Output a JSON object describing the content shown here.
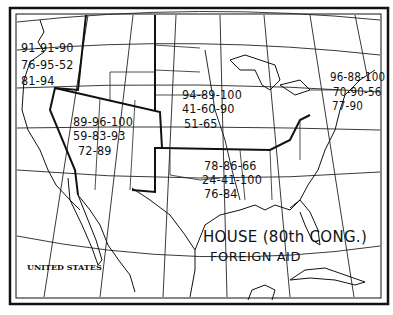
{
  "map": {
    "title_line1": "HOUSE (80th CONG.)",
    "title_line2": "FOREIGN AID",
    "country_label": "UNITED STATES",
    "regions": [
      {
        "name": "pacific-northwest",
        "rows": [
          "91-91-90",
          "76-95-52",
          "81-94"
        ]
      },
      {
        "name": "mountain-west",
        "rows": [
          "89-96-100",
          "59-83-93",
          "72-89"
        ]
      },
      {
        "name": "midwest",
        "rows": [
          "94-89-100",
          "41-60-90",
          "51-65"
        ]
      },
      {
        "name": "northeast",
        "rows": [
          "96-88-100",
          "70-90-56",
          "77-90"
        ]
      },
      {
        "name": "south",
        "rows": [
          "78-86-66",
          "24-41-100",
          "76-84"
        ]
      }
    ]
  }
}
